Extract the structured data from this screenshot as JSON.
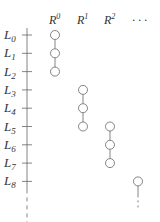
{
  "diagram": {
    "rows": [
      {
        "base": "L",
        "sub": "0"
      },
      {
        "base": "L",
        "sub": "1"
      },
      {
        "base": "L",
        "sub": "2"
      },
      {
        "base": "L",
        "sub": "3"
      },
      {
        "base": "L",
        "sub": "4"
      },
      {
        "base": "L",
        "sub": "5"
      },
      {
        "base": "L",
        "sub": "6"
      },
      {
        "base": "L",
        "sub": "7"
      },
      {
        "base": "L",
        "sub": "8"
      }
    ],
    "columns": [
      {
        "base": "R",
        "sup": "0"
      },
      {
        "base": "R",
        "sup": "1"
      },
      {
        "base": "R",
        "sup": "2"
      },
      {
        "base": "· · ·",
        "sup": ""
      }
    ],
    "groups": [
      {
        "column": 0,
        "rows": [
          0,
          1,
          2
        ],
        "continues": false
      },
      {
        "column": 1,
        "rows": [
          3,
          4,
          5
        ],
        "continues": false
      },
      {
        "column": 2,
        "rows": [
          5,
          6,
          7
        ],
        "continues": false
      },
      {
        "column": 3,
        "rows": [
          8
        ],
        "continues": true
      }
    ],
    "axis_continues": true
  }
}
